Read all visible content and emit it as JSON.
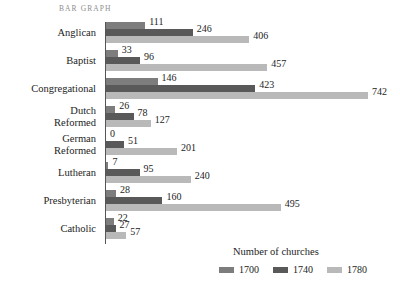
{
  "figure": {
    "label": "BAR GRAPH"
  },
  "chart_data": {
    "type": "bar",
    "orientation": "horizontal",
    "title": "BAR GRAPH",
    "xlabel": "",
    "ylabel": "",
    "legend_title": "Number of churches",
    "legend_position": "bottom-right",
    "grid": false,
    "xlim": [
      0,
      742
    ],
    "categories": [
      "Anglican",
      "Baptist",
      "Congregational",
      "Dutch\nReformed",
      "German\nReformed",
      "Lutheran",
      "Presbyterian",
      "Catholic"
    ],
    "series": [
      {
        "name": "1700",
        "color": "#7d7d7d",
        "values": [
          111,
          33,
          146,
          26,
          0,
          7,
          28,
          22
        ]
      },
      {
        "name": "1740",
        "color": "#595959",
        "values": [
          246,
          96,
          423,
          78,
          51,
          95,
          160,
          27
        ]
      },
      {
        "name": "1780",
        "color": "#b9b9b9",
        "values": [
          406,
          457,
          742,
          127,
          201,
          240,
          495,
          57
        ]
      }
    ],
    "value_labels": [
      [
        "111",
        "246",
        "406"
      ],
      [
        "33",
        "96",
        "457"
      ],
      [
        "146",
        "423",
        "742"
      ],
      [
        "26",
        "78",
        "127"
      ],
      [
        "0",
        "51",
        "201"
      ],
      [
        "7",
        "95",
        "240"
      ],
      [
        "28",
        "160",
        "495"
      ],
      [
        "22",
        "27",
        "57"
      ]
    ]
  },
  "colors": {
    "background": "#ffffff",
    "axis": "#555555",
    "text": "#1d1d1d",
    "title": "#8d8d8d",
    "series_1700": "#7d7d7d",
    "series_1740": "#595959",
    "series_1780": "#b9b9b9"
  }
}
